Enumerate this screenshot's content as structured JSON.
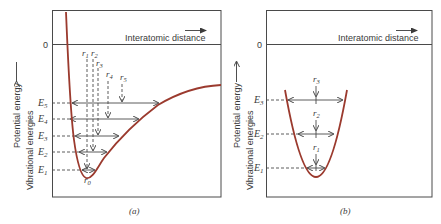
{
  "figure": {
    "panels": [
      {
        "id": "a",
        "caption": "(a)",
        "zero_label": "0",
        "x_axis_label": "Interatomic distance",
        "y_axis_label_outer": "Potential energy",
        "y_axis_label_inner": "Vibrational energies",
        "curve_type": "anharmonic potential well",
        "energy_levels": [
          "E5",
          "E4",
          "E3",
          "E2",
          "E1"
        ],
        "energy_level_labels": {
          "E5": "E",
          "E5s": "5",
          "E4": "E",
          "E4s": "4",
          "E3": "E",
          "E3s": "3",
          "E2": "E",
          "E2s": "2",
          "E1": "E",
          "E1s": "1"
        },
        "positions": [
          "r1",
          "r2",
          "r3",
          "r4",
          "r5"
        ],
        "position_labels": {
          "r1": "r",
          "r1s": "1",
          "r2": "r",
          "r2s": "2",
          "r3": "r",
          "r3s": "3",
          "r4": "r",
          "r4s": "4",
          "r5": "r",
          "r5s": "5",
          "r0": "r",
          "r0s": "0"
        }
      },
      {
        "id": "b",
        "caption": "(b)",
        "zero_label": "0",
        "x_axis_label": "Interatomic distance",
        "y_axis_label_outer": "Potential energy",
        "y_axis_label_inner": "Vibrational energies",
        "curve_type": "harmonic (parabolic) potential well",
        "energy_levels": [
          "E3",
          "E2",
          "E1"
        ],
        "energy_level_labels": {
          "E3": "E",
          "E3s": "3",
          "E2": "E",
          "E2s": "2",
          "E1": "E",
          "E1s": "1"
        },
        "positions": [
          "r1",
          "r2",
          "r3"
        ],
        "position_labels": {
          "r1": "r",
          "r1s": "1",
          "r2": "r",
          "r2s": "2",
          "r3": "r",
          "r3s": "3"
        }
      }
    ],
    "colors": {
      "curve": "#9b3a2e",
      "lines": "#4a4a4a",
      "text": "#3a3a3a",
      "background": "#ffffff"
    }
  }
}
